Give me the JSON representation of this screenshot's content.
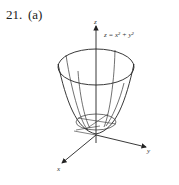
{
  "problem": {
    "number": "21.",
    "part": "(a)"
  },
  "figure": {
    "equation": "z = x² + y²",
    "axes": {
      "x": "x",
      "y": "y",
      "z": "z"
    },
    "surface": "paraboloid"
  }
}
